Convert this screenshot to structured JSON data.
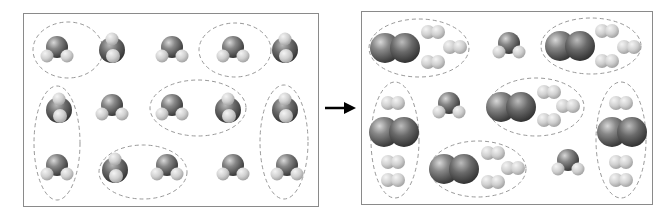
{
  "diagram": {
    "left_panel": {
      "label": "reactants",
      "molecule_type": "NH3",
      "molecule_count": 15,
      "dashed_groups": 6
    },
    "arrow": {
      "direction": "right"
    },
    "right_panel": {
      "label": "products",
      "n2_count": 6,
      "h2_count": 18,
      "unreacted_nh3_count": 3,
      "dashed_groups": 6
    },
    "colors": {
      "frame": "#8a8a8a",
      "nitrogen": "#6a6a6a",
      "hydrogen": "#cfcfcf",
      "dashed": "#999999",
      "arrow": "#000000"
    }
  }
}
